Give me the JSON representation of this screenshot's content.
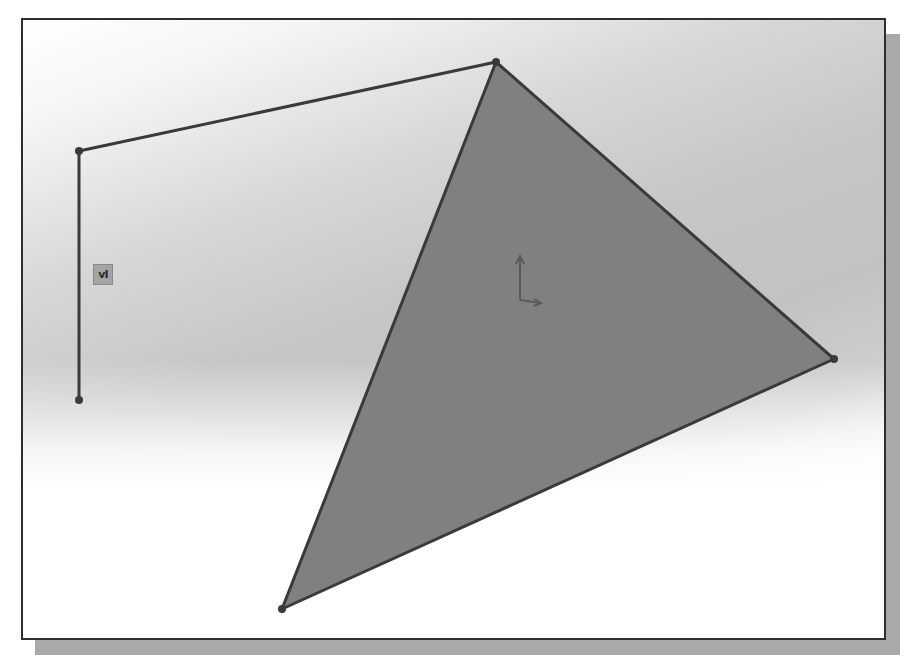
{
  "viewport": {
    "background_top_color": "#f4f4f4",
    "background_mid_color": "#c2c2c2",
    "background_bottom_color": "#ffffff",
    "frame_border_color": "#2e2e2e",
    "shadow_color": "#a9a9a9"
  },
  "sketch": {
    "line_color": "#3a3a3a",
    "point_color": "#3a3a3a",
    "open_polyline": {
      "points": [
        [
          79,
          400
        ],
        [
          79,
          151
        ],
        [
          496,
          62
        ]
      ]
    },
    "triangle": {
      "fill_color": "#808080",
      "points": [
        [
          496,
          62
        ],
        [
          834,
          359
        ],
        [
          282,
          609
        ]
      ]
    },
    "endpoints": [
      {
        "name": "vertical-line-bottom-point",
        "x": 79,
        "y": 400
      },
      {
        "name": "vertical-line-top-point",
        "x": 79,
        "y": 151
      },
      {
        "name": "triangle-top-point",
        "x": 496,
        "y": 62
      },
      {
        "name": "triangle-right-point",
        "x": 834,
        "y": 359
      },
      {
        "name": "triangle-bottom-point",
        "x": 282,
        "y": 609
      }
    ],
    "relation_badge": {
      "icon": "vertical-relation-icon",
      "glyph": "vI"
    },
    "origin": {
      "icon": "sketch-origin-icon",
      "x": 519,
      "y": 302
    }
  }
}
